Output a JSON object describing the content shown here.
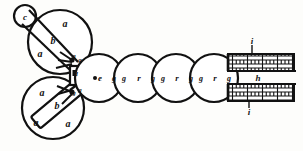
{
  "figure": {
    "background_color": "#fdfdfb",
    "ink_color": "#111111",
    "width": 303,
    "height": 151
  },
  "labels": {
    "small_circle_c": "c",
    "upper_wheel_a1": "a",
    "upper_wheel_a2": "a",
    "upper_bar_b": "b",
    "upper_joint_g1": "g",
    "upper_joint_g2": "g",
    "center_block_d": "d",
    "lower_joint_g1": "g",
    "lower_joint_g2": "g",
    "lower_wheel_a1": "a",
    "lower_wheel_a2": "a",
    "lower_wheel_a3": "a",
    "lower_bar_b": "b",
    "roller_e": "e",
    "chain_g_1": "g",
    "chain_g_2": "g",
    "chain_r_1": "r",
    "chain_g_3": "g",
    "chain_g_4": "g",
    "chain_r_2": "r",
    "chain_g_5": "g",
    "chain_g_6": "g",
    "chain_r_3": "r",
    "chain_g_7": "g",
    "brick_top_i": "i",
    "brick_middle_h": "h",
    "brick_bottom_i": "i"
  },
  "parts": {
    "upper_wheel": {
      "cx": 60,
      "cy": 42,
      "r": 32
    },
    "lower_wheel": {
      "cx": 53,
      "cy": 108,
      "r": 31
    },
    "pivot_circle": {
      "cx": 25,
      "cy": 16,
      "r": 11
    },
    "chain_circles": [
      {
        "cx": 99,
        "cy": 78,
        "r": 24
      },
      {
        "cx": 138,
        "cy": 78,
        "r": 24
      },
      {
        "cx": 176,
        "cy": 78,
        "r": 24
      },
      {
        "cx": 214,
        "cy": 78,
        "r": 24
      }
    ],
    "center_block": {
      "x": 70,
      "y": 68,
      "w": 11,
      "h": 17
    },
    "brick_bar_top": {
      "x": 228,
      "y": 54,
      "w": 66,
      "h": 17
    },
    "brick_bar_bottom": {
      "x": 228,
      "y": 84,
      "w": 66,
      "h": 17
    }
  }
}
